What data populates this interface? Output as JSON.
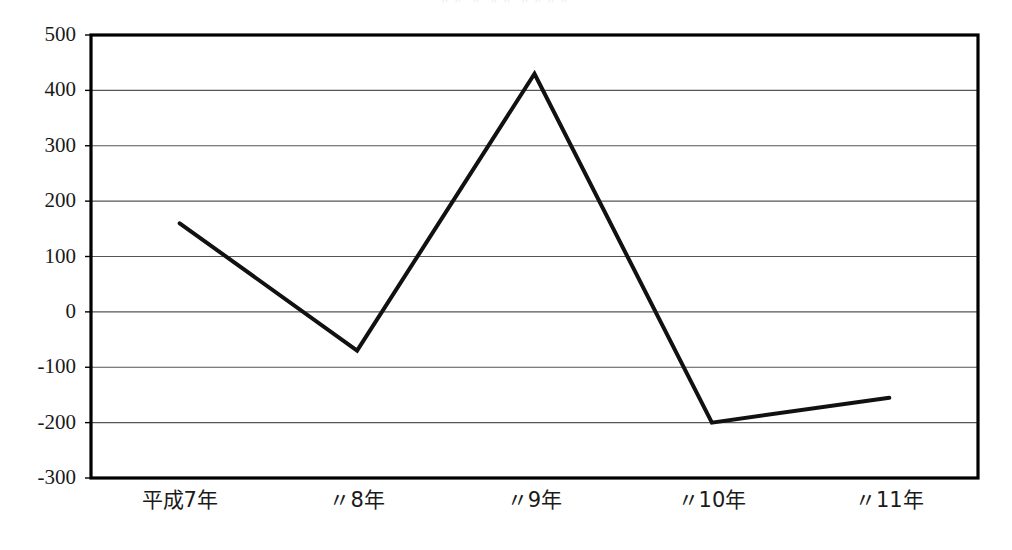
{
  "chart_data": {
    "type": "line",
    "title": "",
    "xlabel": "",
    "ylabel": "",
    "categories": [
      "平成7年",
      "〃8年",
      "〃9年",
      "〃10年",
      "〃11年"
    ],
    "values": [
      160,
      -70,
      430,
      -200,
      -155
    ],
    "series": [
      {
        "name": "series-1",
        "values": [
          160,
          -70,
          430,
          -200,
          -155
        ]
      }
    ],
    "ylim": [
      -300,
      500
    ],
    "ytick_labels": [
      "500",
      "400",
      "300",
      "200",
      "100",
      "0",
      "-100",
      "-200",
      "-300"
    ],
    "ytick_values": [
      500,
      400,
      300,
      200,
      100,
      0,
      -100,
      -200,
      -300
    ],
    "grid": true,
    "grid_axis": "y",
    "legend": false,
    "legend_position": "none",
    "line_color": "#111111",
    "grid_color": "#555555",
    "axis_color": "#000000",
    "background_color": "#ffffff",
    "markers": false,
    "line_width": 4
  },
  "chart": {
    "title_remnant": "〃〃 〃 〃〃 〃〃〃〃",
    "plot_area": {
      "left": 91,
      "top": 35,
      "right": 978,
      "bottom": 478
    }
  }
}
